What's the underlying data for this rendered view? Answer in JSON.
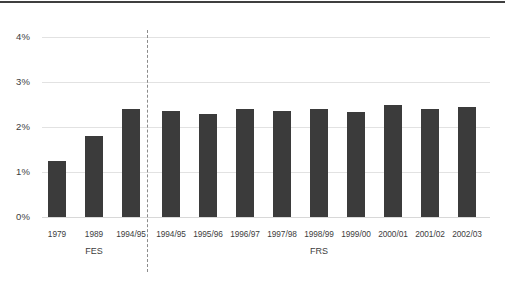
{
  "chart_data": {
    "type": "bar",
    "title": "",
    "subtitle": "",
    "xlabel": "",
    "ylabel": "",
    "ylim": [
      0,
      4
    ],
    "ytick_labels": [
      "0%",
      "1%",
      "2%",
      "3%",
      "4%"
    ],
    "ytick_values": [
      0,
      1,
      2,
      3,
      4
    ],
    "grid": true,
    "legend": "none",
    "categories": [
      "1979",
      "1989",
      "1994/95",
      "1994/95",
      "1995/96",
      "1996/97",
      "1997/98",
      "1998/99",
      "1999/00",
      "2000/01",
      "2001/02",
      "2002/03"
    ],
    "values": [
      1.25,
      1.8,
      2.4,
      2.35,
      2.3,
      2.4,
      2.35,
      2.4,
      2.33,
      2.5,
      2.4,
      2.45
    ],
    "bar_color": "#3b3b3b",
    "groups": [
      {
        "label": "FES",
        "categories": [
          "1979",
          "1989",
          "1994/95"
        ]
      },
      {
        "label": "FRS",
        "categories": [
          "1994/95",
          "1995/96",
          "1996/97",
          "1997/98",
          "1998/99",
          "1999/00",
          "2000/01",
          "2001/02",
          "2002/03"
        ]
      }
    ],
    "annotations": [
      {
        "type": "vertical-dashed-divider",
        "between": [
          "FES",
          "FRS"
        ]
      }
    ]
  }
}
